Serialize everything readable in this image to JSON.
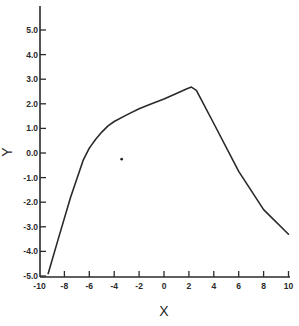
{
  "chart_data": {
    "type": "line",
    "title": "",
    "xlabel": "X",
    "ylabel": "Y",
    "xlim": [
      -10,
      10
    ],
    "ylim": [
      -5.0,
      6.0
    ],
    "grid": false,
    "legend": null,
    "x_ticks": [
      -10,
      -8,
      -6,
      -4,
      -2,
      0,
      2,
      4,
      6,
      8,
      10
    ],
    "x_tick_labels": [
      "-10",
      "-8",
      "-6",
      "-4",
      "-2",
      "0",
      "2",
      "4",
      "6",
      "8",
      "10"
    ],
    "y_ticks": [
      5.0,
      4.0,
      3.0,
      2.0,
      1.0,
      0.0,
      -1.0,
      -2.0,
      -3.0,
      -4.0,
      -5.0
    ],
    "y_tick_labels": [
      "5.0",
      "4.0",
      "3.0",
      "2.0",
      "1.0",
      "0.0",
      "-1.0",
      "-2.0",
      "-3.0",
      "-4.0",
      "-5.0"
    ],
    "series": [
      {
        "name": "curve",
        "color": "#2a2a2a",
        "x": [
          -9.3,
          -8.5,
          -7.5,
          -6.5,
          -6.0,
          -5.5,
          -5.0,
          -4.5,
          -4.0,
          -3.0,
          -2.0,
          -1.0,
          0.0,
          1.0,
          1.8,
          2.2,
          2.6,
          4.0,
          6.0,
          8.0,
          10.0
        ],
        "y": [
          -4.9,
          -3.5,
          -1.8,
          -0.3,
          0.2,
          0.55,
          0.85,
          1.1,
          1.28,
          1.55,
          1.8,
          2.0,
          2.2,
          2.42,
          2.6,
          2.68,
          2.55,
          1.2,
          -0.75,
          -2.3,
          -3.3
        ]
      }
    ],
    "annotations": [
      {
        "type": "point",
        "x": -3.4,
        "y": -0.25,
        "label": ""
      }
    ]
  }
}
